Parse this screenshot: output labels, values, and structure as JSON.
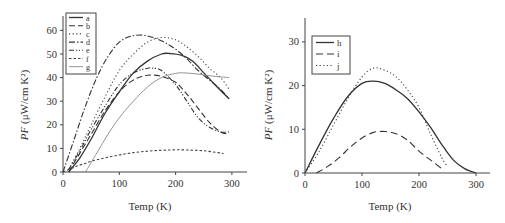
{
  "chart_data": [
    {
      "type": "line",
      "title": "",
      "xlabel": "Temp (K)",
      "ylabel": "PF (μW/cm K²)",
      "xlim": [
        0,
        330
      ],
      "ylim": [
        0,
        65
      ],
      "xticks": [
        0,
        100,
        200,
        300
      ],
      "yticks": [
        0,
        10,
        20,
        30,
        40,
        50,
        60
      ],
      "grid": false,
      "legend_position": "upper-left",
      "series": [
        {
          "name": "a",
          "style": "solid",
          "color": "#333333",
          "x": [
            10,
            30,
            50,
            75,
            100,
            125,
            150,
            175,
            190,
            210,
            230,
            250,
            270,
            295
          ],
          "y": [
            0,
            6,
            14,
            25,
            34,
            42,
            47,
            50,
            50.2,
            49.5,
            47,
            42,
            37,
            31
          ]
        },
        {
          "name": "b",
          "style": "longdash",
          "color": "#333333",
          "x": [
            10,
            30,
            50,
            75,
            100,
            125,
            150,
            175,
            200,
            220,
            240,
            260,
            280,
            295
          ],
          "y": [
            0,
            8,
            16,
            26,
            34,
            39,
            41,
            40.5,
            38,
            33,
            27,
            21,
            17,
            16
          ]
        },
        {
          "name": "c",
          "style": "dotted",
          "color": "#444444",
          "x": [
            10,
            30,
            50,
            75,
            100,
            125,
            150,
            175,
            200,
            220,
            240,
            260,
            280,
            295
          ],
          "y": [
            1,
            10,
            20,
            32,
            43,
            50,
            55,
            57,
            56,
            53,
            49,
            44,
            40,
            35
          ]
        },
        {
          "name": "d",
          "style": "dashdot",
          "color": "#333333",
          "x": [
            0,
            20,
            40,
            60,
            80,
            100,
            120,
            140,
            160,
            180,
            200,
            220,
            240,
            260,
            280,
            295
          ],
          "y": [
            0,
            14,
            28,
            40,
            49,
            55,
            57.5,
            58,
            57,
            55,
            52,
            48,
            43,
            39,
            35,
            31
          ]
        },
        {
          "name": "e",
          "style": "dashdotdot",
          "color": "#333333",
          "x": [
            10,
            30,
            50,
            75,
            100,
            125,
            150,
            160,
            175,
            200,
            220,
            240,
            260,
            280,
            295
          ],
          "y": [
            1,
            9,
            18,
            28,
            37,
            42,
            44,
            44,
            43,
            37,
            30,
            23,
            19,
            17,
            17
          ]
        },
        {
          "name": "f",
          "style": "shortdash",
          "color": "#444444",
          "x": [
            0,
            25,
            50,
            75,
            100,
            125,
            150,
            175,
            200,
            225,
            250,
            275,
            285
          ],
          "y": [
            0,
            2.5,
            4.5,
            6,
            7.2,
            8.2,
            8.8,
            9.2,
            9.4,
            9.3,
            9,
            8.2,
            7.8
          ]
        },
        {
          "name": "g",
          "style": "solid-thin",
          "color": "#888888",
          "x": [
            40,
            60,
            80,
            100,
            125,
            150,
            175,
            200,
            215,
            240,
            260,
            280,
            295
          ],
          "y": [
            0,
            8,
            16,
            23,
            30,
            36,
            40,
            41.8,
            42,
            41.5,
            40.8,
            40.3,
            40
          ]
        }
      ]
    },
    {
      "type": "line",
      "title": "",
      "xlabel": "Temp (K)",
      "ylabel": "PF (μW/cm K²)",
      "xlim": [
        0,
        320
      ],
      "ylim": [
        0,
        35
      ],
      "xticks": [
        0,
        100,
        200,
        300
      ],
      "yticks": [
        0,
        10,
        20,
        30
      ],
      "grid": false,
      "legend_position": "upper-left",
      "series": [
        {
          "name": "h",
          "style": "solid",
          "color": "#333333",
          "x": [
            0,
            25,
            50,
            75,
            100,
            120,
            140,
            160,
            180,
            200,
            220,
            240,
            260,
            280,
            300
          ],
          "y": [
            0,
            6.5,
            12.5,
            17.5,
            20.5,
            21,
            20.5,
            19,
            17,
            14,
            10.5,
            6.5,
            3,
            1,
            0
          ]
        },
        {
          "name": "i",
          "style": "dashed",
          "color": "#333333",
          "x": [
            20,
            40,
            60,
            80,
            100,
            120,
            140,
            160,
            180,
            200,
            220,
            240
          ],
          "y": [
            0,
            1.5,
            3.5,
            6,
            8,
            9.3,
            9.5,
            9,
            7.5,
            5,
            3,
            1
          ]
        },
        {
          "name": "j",
          "style": "dotted",
          "color": "#444444",
          "x": [
            0,
            25,
            50,
            75,
            100,
            120,
            140,
            160,
            180,
            200,
            220,
            240,
            250
          ],
          "y": [
            0,
            5,
            11,
            17,
            22,
            24,
            23.5,
            22,
            19,
            15,
            9,
            3.5,
            1.5
          ]
        }
      ]
    }
  ],
  "left_panel": {
    "xlabel": "Temp (K)",
    "ylabel_italic": "PF",
    "ylabel_units": " (μW/cm K²)",
    "xtick_labels": [
      "0",
      "100",
      "200",
      "300"
    ],
    "ytick_labels": [
      "0",
      "10",
      "20",
      "30",
      "40",
      "50",
      "60"
    ],
    "legend": [
      "a",
      "b",
      "c",
      "d",
      "e",
      "f",
      "g"
    ]
  },
  "right_panel": {
    "xlabel": "Temp (K)",
    "ylabel_italic": "PF",
    "ylabel_units": " (μW/cm K²)",
    "xtick_labels": [
      "0",
      "100",
      "200",
      "300"
    ],
    "ytick_labels": [
      "0",
      "10",
      "20",
      "30"
    ],
    "legend": [
      "h",
      "i",
      "j"
    ]
  }
}
